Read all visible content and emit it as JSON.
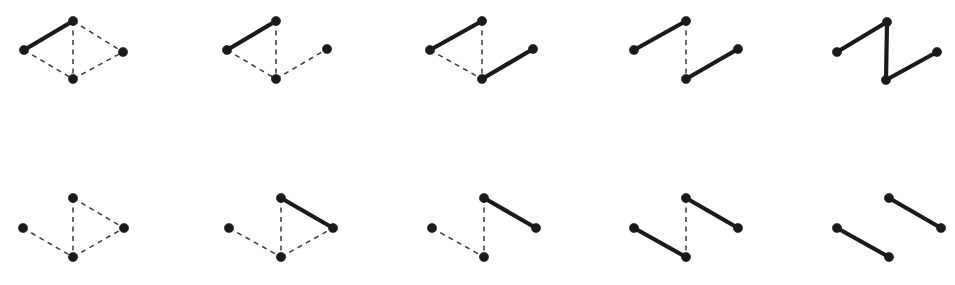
{
  "canvas": {
    "width": 955,
    "height": 285,
    "background": "#ffffff"
  },
  "style": {
    "solid_edge_color": "#1a1a1a",
    "solid_edge_width": 4.2,
    "dashed_edge_color": "#3a3a3a",
    "dashed_edge_width": 1.5,
    "dash_pattern": "5 4.5",
    "node_color": "#1a1a1a",
    "node_radius": 4.6
  },
  "graph": {
    "node_keys": [
      "left",
      "top",
      "bottom",
      "right"
    ],
    "edge_keys": [
      "left-top",
      "top-bottom",
      "bottom-right",
      "left-bottom",
      "top-right",
      "bottom-right-dash"
    ]
  },
  "figures": [
    {
      "id": "fig-r1c1",
      "row": 1,
      "col": 1,
      "origin": [
        0,
        0
      ],
      "nodes": {
        "left": [
          24,
          50
        ],
        "top": [
          73,
          21
        ],
        "bottom": [
          73,
          79
        ],
        "right": [
          123,
          52
        ]
      },
      "edges": [
        {
          "name": "left-top",
          "from": "left",
          "to": "top",
          "style": "solid"
        },
        {
          "name": "top-bottom",
          "from": "top",
          "to": "bottom",
          "style": "dashed"
        },
        {
          "name": "left-bottom",
          "from": "left",
          "to": "bottom",
          "style": "dashed"
        },
        {
          "name": "top-right",
          "from": "top",
          "to": "right",
          "style": "dashed"
        },
        {
          "name": "bottom-right",
          "from": "bottom",
          "to": "right",
          "style": "dashed"
        }
      ]
    },
    {
      "id": "fig-r1c2",
      "row": 1,
      "col": 2,
      "origin": [
        203,
        0
      ],
      "nodes": {
        "left": [
          24,
          50
        ],
        "top": [
          73,
          21
        ],
        "bottom": [
          73,
          79
        ],
        "right": [
          124,
          49
        ]
      },
      "edges": [
        {
          "name": "left-top",
          "from": "left",
          "to": "top",
          "style": "solid"
        },
        {
          "name": "top-bottom",
          "from": "top",
          "to": "bottom",
          "style": "dashed"
        },
        {
          "name": "left-bottom",
          "from": "left",
          "to": "bottom",
          "style": "dashed"
        },
        {
          "name": "bottom-right",
          "from": "bottom",
          "to": "right",
          "style": "dashed"
        }
      ]
    },
    {
      "id": "fig-r1c3",
      "row": 1,
      "col": 3,
      "origin": [
        406,
        0
      ],
      "nodes": {
        "left": [
          24,
          50
        ],
        "top": [
          76,
          21
        ],
        "bottom": [
          76,
          79
        ],
        "right": [
          127,
          49
        ]
      },
      "edges": [
        {
          "name": "left-top",
          "from": "left",
          "to": "top",
          "style": "solid"
        },
        {
          "name": "top-bottom",
          "from": "top",
          "to": "bottom",
          "style": "dashed"
        },
        {
          "name": "left-bottom",
          "from": "left",
          "to": "bottom",
          "style": "dashed"
        },
        {
          "name": "bottom-right",
          "from": "bottom",
          "to": "right",
          "style": "solid"
        }
      ]
    },
    {
      "id": "fig-r1c4",
      "row": 1,
      "col": 4,
      "origin": [
        604,
        0
      ],
      "nodes": {
        "left": [
          30,
          50
        ],
        "top": [
          82,
          21
        ],
        "bottom": [
          82,
          79
        ],
        "right": [
          134,
          49
        ]
      },
      "edges": [
        {
          "name": "left-top",
          "from": "left",
          "to": "top",
          "style": "solid"
        },
        {
          "name": "top-bottom",
          "from": "top",
          "to": "bottom",
          "style": "dashed"
        },
        {
          "name": "bottom-right",
          "from": "bottom",
          "to": "right",
          "style": "solid"
        }
      ]
    },
    {
      "id": "fig-r1c5",
      "row": 1,
      "col": 5,
      "origin": [
        803,
        0
      ],
      "nodes": {
        "left": [
          34,
          52
        ],
        "top": [
          84,
          22
        ],
        "bottom": [
          83,
          80
        ],
        "right": [
          134,
          52
        ]
      },
      "edges": [
        {
          "name": "left-top",
          "from": "left",
          "to": "top",
          "style": "solid"
        },
        {
          "name": "top-bottom",
          "from": "top",
          "to": "bottom",
          "style": "solid"
        },
        {
          "name": "bottom-right",
          "from": "bottom",
          "to": "right",
          "style": "solid"
        }
      ]
    },
    {
      "id": "fig-r2c1",
      "row": 2,
      "col": 1,
      "origin": [
        0,
        178
      ],
      "nodes": {
        "left": [
          23,
          50
        ],
        "top": [
          73,
          20
        ],
        "bottom": [
          73,
          79
        ],
        "right": [
          124,
          50
        ]
      },
      "edges": [
        {
          "name": "top-bottom",
          "from": "top",
          "to": "bottom",
          "style": "dashed"
        },
        {
          "name": "left-bottom",
          "from": "left",
          "to": "bottom",
          "style": "dashed"
        },
        {
          "name": "top-right",
          "from": "top",
          "to": "right",
          "style": "dashed"
        },
        {
          "name": "bottom-right",
          "from": "bottom",
          "to": "right",
          "style": "dashed"
        }
      ]
    },
    {
      "id": "fig-r2c2",
      "row": 2,
      "col": 2,
      "origin": [
        203,
        178
      ],
      "nodes": {
        "left": [
          26,
          50
        ],
        "top": [
          78,
          20
        ],
        "bottom": [
          78,
          79
        ],
        "right": [
          130,
          50
        ]
      },
      "edges": [
        {
          "name": "top-bottom",
          "from": "top",
          "to": "bottom",
          "style": "dashed"
        },
        {
          "name": "left-bottom",
          "from": "left",
          "to": "bottom",
          "style": "dashed"
        },
        {
          "name": "top-right",
          "from": "top",
          "to": "right",
          "style": "solid"
        },
        {
          "name": "bottom-right",
          "from": "bottom",
          "to": "right",
          "style": "dashed"
        }
      ]
    },
    {
      "id": "fig-r2c3",
      "row": 2,
      "col": 3,
      "origin": [
        406,
        178
      ],
      "nodes": {
        "left": [
          26,
          50
        ],
        "top": [
          78,
          20
        ],
        "bottom": [
          78,
          79
        ],
        "right": [
          130,
          50
        ]
      },
      "edges": [
        {
          "name": "top-bottom",
          "from": "top",
          "to": "bottom",
          "style": "dashed"
        },
        {
          "name": "left-bottom",
          "from": "left",
          "to": "bottom",
          "style": "dashed"
        },
        {
          "name": "top-right",
          "from": "top",
          "to": "right",
          "style": "solid"
        }
      ]
    },
    {
      "id": "fig-r2c4",
      "row": 2,
      "col": 4,
      "origin": [
        604,
        178
      ],
      "nodes": {
        "left": [
          30,
          50
        ],
        "top": [
          82,
          20
        ],
        "bottom": [
          82,
          79
        ],
        "right": [
          134,
          50
        ]
      },
      "edges": [
        {
          "name": "top-bottom",
          "from": "top",
          "to": "bottom",
          "style": "dashed"
        },
        {
          "name": "left-bottom",
          "from": "left",
          "to": "bottom",
          "style": "solid"
        },
        {
          "name": "top-right",
          "from": "top",
          "to": "right",
          "style": "solid"
        }
      ]
    },
    {
      "id": "fig-r2c5",
      "row": 2,
      "col": 5,
      "origin": [
        803,
        178
      ],
      "nodes": {
        "left": [
          34,
          50
        ],
        "top": [
          86,
          20
        ],
        "bottom": [
          86,
          79
        ],
        "right": [
          138,
          50
        ]
      },
      "edges": [
        {
          "name": "left-bottom",
          "from": "left",
          "to": "bottom",
          "style": "solid"
        },
        {
          "name": "top-right",
          "from": "top",
          "to": "right",
          "style": "solid"
        }
      ]
    }
  ]
}
